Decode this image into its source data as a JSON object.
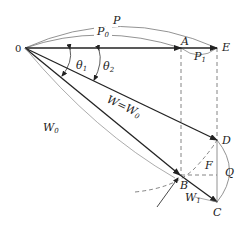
{
  "diagram": {
    "type": "vector-diagram",
    "colors": {
      "line": "#222222",
      "thin": "#666666",
      "dashed": "#555555",
      "background": "#ffffff"
    },
    "points": {
      "O": {
        "label": "0",
        "x": 25,
        "y": 48
      },
      "A": {
        "label": "A",
        "x": 181,
        "y": 48
      },
      "E": {
        "label": "E",
        "x": 217,
        "y": 48
      },
      "D": {
        "label": "D",
        "x": 217,
        "y": 140
      },
      "B": {
        "label": "B",
        "x": 180,
        "y": 175
      },
      "C": {
        "label": "C",
        "x": 217,
        "y": 202
      },
      "F": {
        "label": "F",
        "x": 217,
        "y": 175
      },
      "Q": {
        "label": "Q",
        "x": 229,
        "y": 172
      }
    },
    "labels": {
      "P": "P",
      "P0_main": "P",
      "P0_sub": "0",
      "P1_main": "P",
      "P1_sub": "1",
      "theta1_main": "θ",
      "theta1_sub": "1",
      "theta2_main": "θ",
      "theta2_sub": "2",
      "W_eq_W0": "W=W",
      "W_eq_W0_sub": "0",
      "W0_main": "W",
      "W0_sub": "0",
      "W1_main": "W",
      "W1_sub": "1",
      "origin": "0",
      "A": "A",
      "E": "E",
      "D": "D",
      "B": "B",
      "C": "C",
      "F": "F",
      "Q": "Q"
    },
    "vectors": [
      {
        "name": "P0",
        "from": "O",
        "to": "A"
      },
      {
        "name": "P1",
        "from": "A",
        "to": "E"
      },
      {
        "name": "W",
        "from": "O",
        "to": "D"
      },
      {
        "name": "W0",
        "from": "O",
        "to": "B"
      },
      {
        "name": "W1",
        "from": "B",
        "to": "C"
      }
    ]
  }
}
